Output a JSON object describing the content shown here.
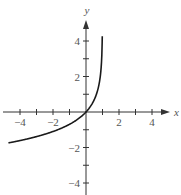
{
  "chart_data": {
    "type": "line",
    "title": "",
    "function": "y = -ln(1 - x)",
    "xlabel": "x",
    "ylabel": "y",
    "xlim": [
      -4.7,
      5
    ],
    "ylim": [
      -4.8,
      5
    ],
    "x_ticks": [
      -4,
      -3,
      -2,
      -1,
      1,
      2,
      3,
      4
    ],
    "x_tick_labels": [
      "-4",
      "-2",
      "2",
      "4"
    ],
    "x_tick_label_values": [
      -4,
      -2,
      2,
      4
    ],
    "y_ticks": [
      -4,
      -3,
      -2,
      -1,
      1,
      2,
      3,
      4
    ],
    "y_tick_labels": [
      "4",
      "2",
      "-2",
      "-4"
    ],
    "y_tick_label_values": [
      4,
      2,
      -2,
      -4
    ],
    "vertical_asymptote": 1,
    "grid": false,
    "legend": null,
    "series": [
      {
        "name": "f(x)",
        "x": [
          -4.7,
          -4,
          -3,
          -2,
          -1,
          -0.5,
          0,
          0.5,
          0.75,
          0.9,
          0.95,
          0.985
        ],
        "y": [
          -1.74,
          -1.61,
          -1.39,
          -1.1,
          -0.69,
          -0.41,
          0,
          0.69,
          1.39,
          2.3,
          3.0,
          4.2
        ]
      }
    ]
  },
  "axes": {
    "x_label": "x",
    "y_label": "y"
  },
  "style": {
    "axis_color": "#333333",
    "curve_color": "#1a1a1a",
    "label_color": "#555555"
  }
}
